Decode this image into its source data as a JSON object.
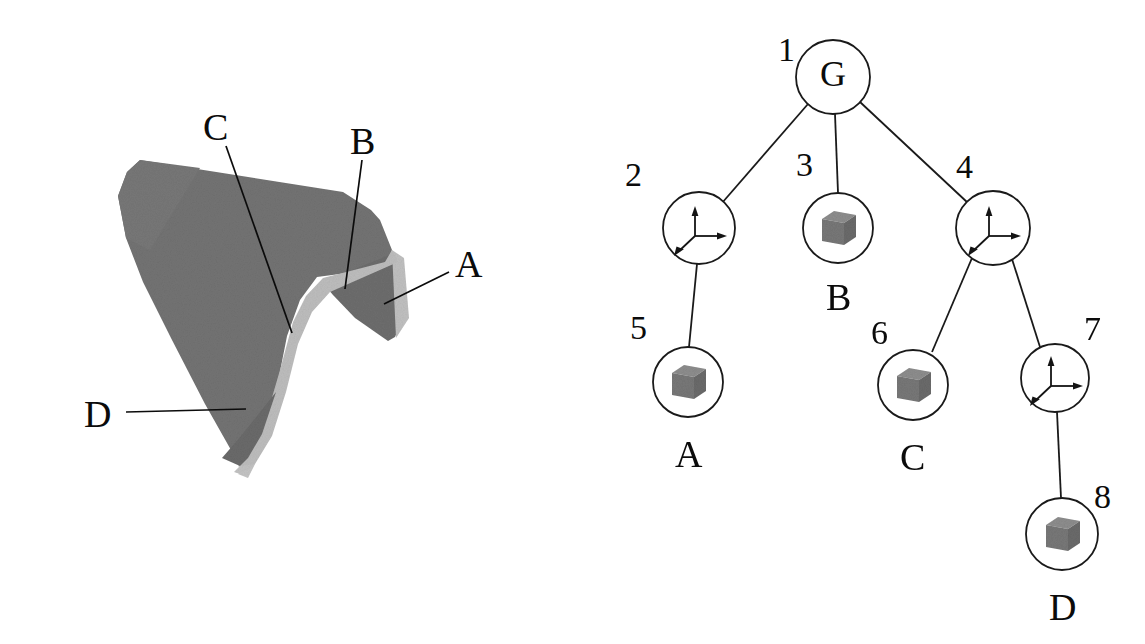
{
  "figure": {
    "kind": "diagram",
    "background_color": "#ffffff",
    "ink_color": "#0b0b0b",
    "panels": [
      "object-panel",
      "tree-panel"
    ]
  },
  "object_panel": {
    "name": "3d-bent-plate-object",
    "description": "Shaded 3D bent sheet-metal part with a V-shaped fold",
    "colors": {
      "face_dark": "#737373",
      "face_mid": "#6e6e6e",
      "edge_light": "#b8b8b8",
      "edge_light2": "#c2c2c2"
    },
    "labels": [
      {
        "id": "A",
        "text": "A",
        "x": 455,
        "y": 245
      },
      {
        "id": "B",
        "text": "B",
        "x": 350,
        "y": 122
      },
      {
        "id": "C",
        "text": "C",
        "x": 203,
        "y": 108
      },
      {
        "id": "D",
        "text": "D",
        "x": 84,
        "y": 395
      }
    ],
    "leaders": [
      {
        "label": "A",
        "from": [
          449,
          272
        ],
        "to": [
          384,
          304
        ]
      },
      {
        "label": "B",
        "from": [
          362,
          160
        ],
        "to": [
          345,
          289
        ]
      },
      {
        "label": "C",
        "from": [
          226,
          146
        ],
        "to": [
          292,
          333
        ]
      },
      {
        "label": "D",
        "from": [
          126,
          412
        ],
        "to": [
          246,
          409
        ]
      }
    ]
  },
  "tree_panel": {
    "name": "part-decomposition-tree",
    "node_radius": 36,
    "nodes": [
      {
        "id": 1,
        "index_label": "1",
        "x": 833,
        "y": 77,
        "glyph": "letter",
        "glyph_value": "G",
        "caption": "",
        "radius": 37
      },
      {
        "id": 2,
        "index_label": "2",
        "x": 699,
        "y": 228,
        "glyph": "frame",
        "glyph_value": "coordinate-frame",
        "caption": "",
        "radius": 36
      },
      {
        "id": 3,
        "index_label": "3",
        "x": 838,
        "y": 228,
        "glyph": "cube",
        "glyph_value": "cube",
        "caption": "B",
        "radius": 35
      },
      {
        "id": 4,
        "index_label": "4",
        "x": 993,
        "y": 228,
        "glyph": "frame",
        "glyph_value": "coordinate-frame",
        "caption": "",
        "radius": 37
      },
      {
        "id": 5,
        "index_label": "5",
        "x": 688,
        "y": 382,
        "glyph": "cube",
        "glyph_value": "cube",
        "caption": "A",
        "radius": 35
      },
      {
        "id": 6,
        "index_label": "6",
        "x": 913,
        "y": 385,
        "glyph": "cube",
        "glyph_value": "cube",
        "caption": "C",
        "radius": 35
      },
      {
        "id": 7,
        "index_label": "7",
        "x": 1055,
        "y": 378,
        "glyph": "frame",
        "glyph_value": "coordinate-frame",
        "caption": "",
        "radius": 34
      },
      {
        "id": 8,
        "index_label": "8",
        "x": 1062,
        "y": 534,
        "glyph": "cube",
        "glyph_value": "cube",
        "caption": "D",
        "radius": 36
      }
    ],
    "index_label_positions": [
      {
        "id": "1",
        "text": "1",
        "x": 778,
        "y": 33
      },
      {
        "id": "2",
        "text": "2",
        "x": 625,
        "y": 158
      },
      {
        "id": "3",
        "text": "3",
        "x": 796,
        "y": 148
      },
      {
        "id": "4",
        "text": "4",
        "x": 956,
        "y": 150
      },
      {
        "id": "5",
        "text": "5",
        "x": 630,
        "y": 311
      },
      {
        "id": "6",
        "text": "6",
        "x": 871,
        "y": 316
      },
      {
        "id": "7",
        "text": "7",
        "x": 1084,
        "y": 312
      },
      {
        "id": "8",
        "text": "8",
        "x": 1094,
        "y": 480
      }
    ],
    "captions": [
      {
        "id": "A",
        "text": "A",
        "x": 675,
        "y": 435
      },
      {
        "id": "B",
        "text": "B",
        "x": 826,
        "y": 278
      },
      {
        "id": "C",
        "text": "C",
        "x": 900,
        "y": 438
      },
      {
        "id": "D",
        "text": "D",
        "x": 1049,
        "y": 588
      }
    ],
    "edges": [
      {
        "from": 1,
        "to": 2
      },
      {
        "from": 1,
        "to": 3
      },
      {
        "from": 1,
        "to": 4
      },
      {
        "from": 2,
        "to": 5
      },
      {
        "from": 4,
        "to": 6
      },
      {
        "from": 4,
        "to": 7
      },
      {
        "from": 7,
        "to": 8
      }
    ],
    "glyph_colors": {
      "cube_top": "#8c8c8c",
      "cube_front": "#7a7a7a",
      "cube_side": "#6a6a6a",
      "frame_stroke": "#141414",
      "circle_stroke": "#1a1a1a"
    }
  }
}
